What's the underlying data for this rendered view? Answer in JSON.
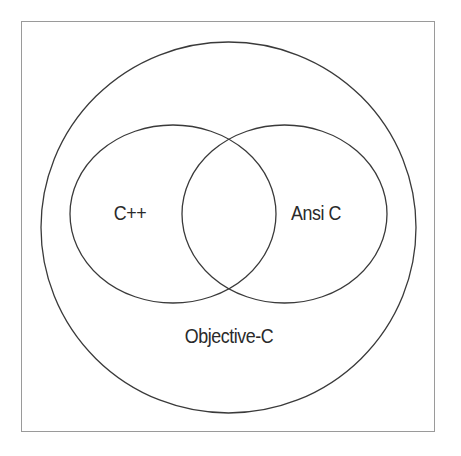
{
  "diagram": {
    "type": "venn",
    "sets": [
      {
        "id": "objective-c",
        "label": "Objective-C",
        "role": "superset"
      },
      {
        "id": "cpp",
        "label": "C++",
        "role": "subset"
      },
      {
        "id": "ansi-c",
        "label": "Ansi C",
        "role": "subset"
      }
    ],
    "relations": [
      {
        "set": "C++",
        "inside": "Objective-C"
      },
      {
        "set": "Ansi C",
        "inside": "Objective-C"
      },
      {
        "overlap": [
          "C++",
          "Ansi C"
        ]
      }
    ],
    "colors": {
      "stroke": "#3a3a3a",
      "frame": "#9a9a9a",
      "background": "#ffffff",
      "text": "#2a2a2a"
    }
  },
  "labels": {
    "outer": "Objective-C",
    "left": "C++",
    "right": "Ansi C"
  }
}
